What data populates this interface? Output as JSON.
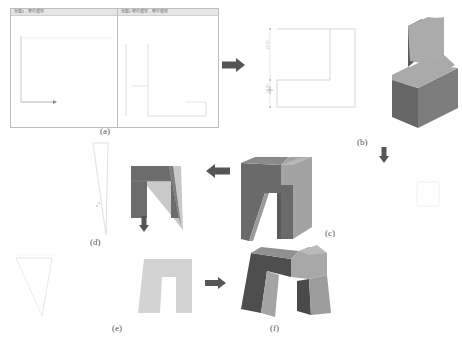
{
  "figure": {
    "panels": [
      {
        "id": "a",
        "caption": "(a)",
        "description": "Two CAD software windows showing 2D sketch workspaces"
      },
      {
        "id": "b",
        "caption": "(b)",
        "description": "L-shaped 2D profile sketch with dimensions and extruded L-shaped 3D solid"
      },
      {
        "id": "c",
        "caption": "(c)",
        "description": "3D solid with arch-shaped cut"
      },
      {
        "id": "d",
        "caption": "(d)",
        "description": "Thin tapered sketch outline and 2D front view of arch profile"
      },
      {
        "id": "e",
        "caption": "(e)",
        "description": "Inverted trapezoid sketch and light gray arch profile"
      },
      {
        "id": "f",
        "caption": "(f)",
        "description": "Final M-shaped 3D solid"
      }
    ],
    "windows": [
      {
        "title": "草图1 - 零件模型"
      },
      {
        "title": "草图2 零件模型 - 零件模型"
      }
    ],
    "dimensions": {
      "b_upper": "20.00",
      "b_lower": "10.00"
    },
    "colors": {
      "solid_dark": "#5c5c5c",
      "solid_mid": "#7a7a7a",
      "solid_light": "#a8a8a8",
      "profile_light": "#d2d2d2",
      "arrow": "#555555",
      "sketch_line": "#c8c8c8"
    }
  }
}
